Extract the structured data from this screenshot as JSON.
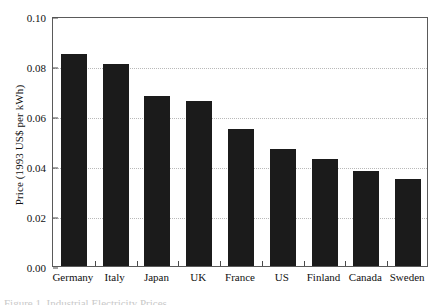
{
  "chart_data": {
    "type": "bar",
    "title": "",
    "xlabel": "",
    "ylabel": "Price (1993 US$ per kWh)",
    "categories": [
      "Germany",
      "Italy",
      "Japan",
      "UK",
      "France",
      "US",
      "Finland",
      "Canada",
      "Sweden"
    ],
    "values": [
      0.085,
      0.081,
      0.068,
      0.066,
      0.055,
      0.047,
      0.043,
      0.038,
      0.035
    ],
    "ylim": [
      0.0,
      0.1
    ],
    "ytick_labels": [
      "0.00",
      "0.02",
      "0.04",
      "0.06",
      "0.08",
      "0.10"
    ],
    "ytick_values": [
      0.0,
      0.02,
      0.04,
      0.06,
      0.08,
      0.1
    ],
    "grid": true,
    "grid_axis": "y",
    "grid_style": "dotted",
    "legend": "none",
    "bar_color": "#1b1b1b",
    "frame_color": "#5a5a5a",
    "grid_color": "#b9b9b9"
  },
  "caption": {
    "text": "Figure 1. Industrial Electricity Prices"
  }
}
